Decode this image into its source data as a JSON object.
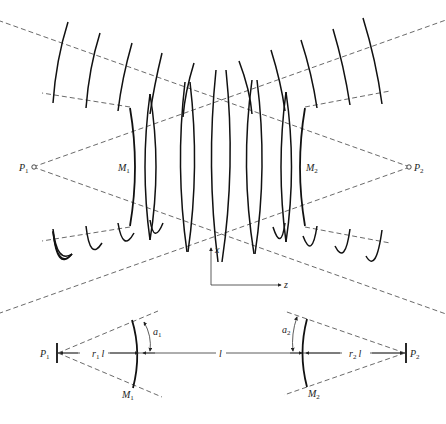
{
  "figure": {
    "type": "optics diagram",
    "top_panel": {
      "description": "Unstable resonator wavefronts between two mirrors with virtual point sources",
      "labels": {
        "p1": "P",
        "p1_sub": "1",
        "p2": "P",
        "p2_sub": "2",
        "m1": "M",
        "m1_sub": "1",
        "m2": "M",
        "m2_sub": "2"
      }
    },
    "axes": {
      "x_label": "x",
      "z_label": "z"
    },
    "bottom_panel": {
      "description": "Resonator geometry with mirror angles and distances",
      "labels": {
        "p1": "P",
        "p1_sub": "1",
        "p2": "P",
        "p2_sub": "2",
        "m1": "M",
        "m1_sub": "1",
        "m2": "M",
        "m2_sub": "2",
        "a1": "a",
        "a1_sub": "1",
        "a2": "a",
        "a2_sub": "2",
        "r1l": "r",
        "r1l_sub": "1",
        "r1l_tail": "l",
        "r2l": "r",
        "r2l_sub": "2",
        "r2l_tail": "l",
        "l": "l"
      }
    },
    "colors": {
      "line": "#111111",
      "dashed": "#444444",
      "background": "#ffffff"
    }
  }
}
